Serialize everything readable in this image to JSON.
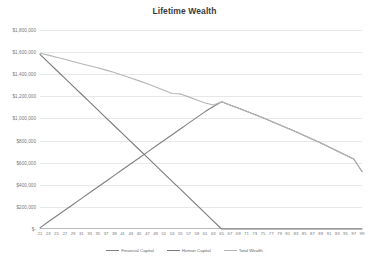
{
  "chart_data": {
    "type": "line",
    "title": "Lifetime Wealth",
    "xlabel": "",
    "ylabel": "",
    "xlim": [
      21,
      99
    ],
    "ylim": [
      0,
      1800000
    ],
    "grid": true,
    "legend_position": "bottom",
    "x_tick_labels": [
      "21",
      "23",
      "25",
      "27",
      "29",
      "31",
      "33",
      "35",
      "37",
      "39",
      "41",
      "43",
      "45",
      "47",
      "49",
      "51",
      "53",
      "55",
      "57",
      "59",
      "61",
      "63",
      "65",
      "67",
      "69",
      "71",
      "73",
      "75",
      "77",
      "79",
      "81",
      "83",
      "85",
      "87",
      "89",
      "91",
      "93",
      "95",
      "97",
      "99"
    ],
    "y_tick_labels": [
      "$1,800,000",
      "$1,600,000",
      "$1,400,000",
      "$1,200,000",
      "$1,000,000",
      "$800,000",
      "$600,000",
      "$400,000",
      "$200,000",
      "$-"
    ],
    "y_tick_values": [
      1800000,
      1600000,
      1400000,
      1200000,
      1000000,
      800000,
      600000,
      400000,
      200000,
      0
    ],
    "x": [
      21,
      23,
      25,
      27,
      29,
      31,
      33,
      35,
      37,
      39,
      41,
      43,
      45,
      47,
      49,
      51,
      53,
      55,
      57,
      59,
      61,
      63,
      65,
      67,
      69,
      71,
      73,
      75,
      77,
      79,
      81,
      83,
      85,
      87,
      89,
      91,
      93,
      95,
      97,
      99
    ],
    "series": [
      {
        "name": "Financial Capital",
        "color": "#808080",
        "values": [
          10000,
          65000,
          118000,
          170000,
          222000,
          275000,
          328000,
          380000,
          432000,
          485000,
          538000,
          590000,
          642000,
          695000,
          748000,
          800000,
          852000,
          905000,
          958000,
          1010000,
          1062000,
          1108000,
          1150000,
          1122000,
          1094000,
          1066000,
          1036000,
          1006000,
          975000,
          944000,
          912000,
          879000,
          846000,
          812000,
          777000,
          742000,
          706000,
          670000,
          633000,
          520000
        ]
      },
      {
        "name": "Human Capital",
        "color": "#7a7a7a",
        "values": [
          1580000,
          1508000,
          1436000,
          1365000,
          1293000,
          1221000,
          1149000,
          1078000,
          1006000,
          934000,
          862000,
          790000,
          719000,
          647000,
          575000,
          503000,
          431000,
          360000,
          288000,
          216000,
          144000,
          72000,
          0,
          0,
          0,
          0,
          0,
          0,
          0,
          0,
          0,
          0,
          0,
          0,
          0,
          0,
          0,
          0,
          0,
          0
        ]
      },
      {
        "name": "Total Wealth",
        "color": "#b5b5b5",
        "values": [
          1590000,
          1573000,
          1554000,
          1535000,
          1515000,
          1494000,
          1477000,
          1458000,
          1437000,
          1415000,
          1391000,
          1366000,
          1340000,
          1313000,
          1285000,
          1256000,
          1226000,
          1222000,
          1195000,
          1167000,
          1140000,
          1122000,
          1150000,
          1122000,
          1094000,
          1066000,
          1036000,
          1006000,
          975000,
          944000,
          912000,
          879000,
          846000,
          812000,
          777000,
          742000,
          706000,
          670000,
          633000,
          520000
        ]
      }
    ]
  },
  "legend": {
    "items": [
      {
        "label": "Financial Capital",
        "color": "#808080"
      },
      {
        "label": "Human Capital",
        "color": "#7a7a7a"
      },
      {
        "label": "Total Wealth",
        "color": "#b5b5b5"
      }
    ]
  }
}
